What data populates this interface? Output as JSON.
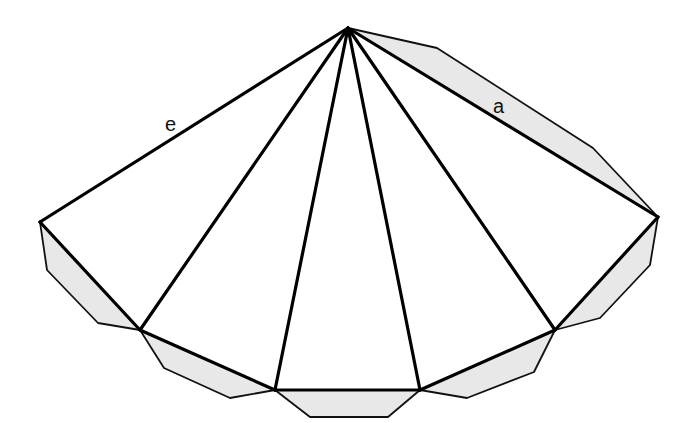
{
  "diagram": {
    "colors": {
      "background": "#ffffff",
      "flap_fill": "#e8e8e8",
      "line": "#000000"
    },
    "labels": {
      "edge_e": "e",
      "edge_a": "a"
    },
    "apex": [
      348,
      28
    ],
    "base_vertices": [
      [
        40,
        222
      ],
      [
        140,
        330
      ],
      [
        275,
        390
      ],
      [
        420,
        390
      ],
      [
        555,
        330
      ],
      [
        658,
        217
      ]
    ],
    "flaps": [
      {
        "name": "flap-side-a",
        "points": "348,28 437,48 593,148 658,217"
      },
      {
        "name": "flap-base-1",
        "points": "40,222 47,270 98,323 140,330"
      },
      {
        "name": "flap-base-2",
        "points": "140,330 164,368 230,398 275,390"
      },
      {
        "name": "flap-base-3",
        "points": "275,390 310,417 388,417 420,390"
      },
      {
        "name": "flap-base-4",
        "points": "420,390 467,398 534,372 555,330"
      },
      {
        "name": "flap-base-5",
        "points": "555,330 600,318 650,265 658,217"
      }
    ]
  }
}
